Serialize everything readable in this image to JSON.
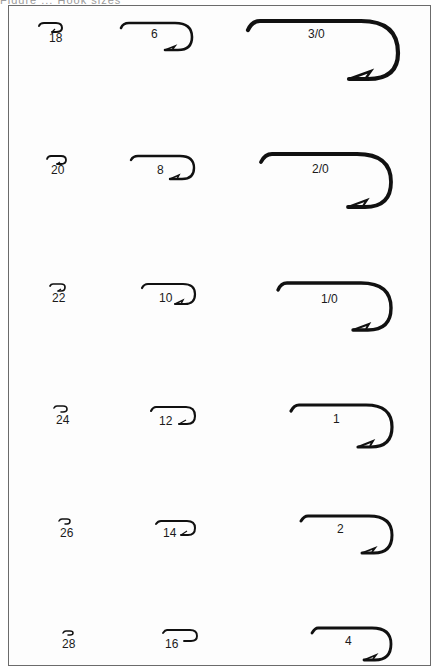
{
  "figure": {
    "caption_fragment": "Figure ... Hook sizes",
    "border_color": "#6b6b6b",
    "ink_color": "#111111",
    "columns": [
      {
        "name": "small",
        "hooks": [
          {
            "size": "18"
          },
          {
            "size": "20"
          },
          {
            "size": "22"
          },
          {
            "size": "24"
          },
          {
            "size": "26"
          },
          {
            "size": "28"
          }
        ]
      },
      {
        "name": "medium",
        "hooks": [
          {
            "size": "6"
          },
          {
            "size": "8"
          },
          {
            "size": "10"
          },
          {
            "size": "12"
          },
          {
            "size": "14"
          },
          {
            "size": "16"
          }
        ]
      },
      {
        "name": "large",
        "hooks": [
          {
            "size": "3/0"
          },
          {
            "size": "2/0"
          },
          {
            "size": "1/0"
          },
          {
            "size": "1"
          },
          {
            "size": "2"
          },
          {
            "size": "4"
          }
        ]
      }
    ]
  }
}
